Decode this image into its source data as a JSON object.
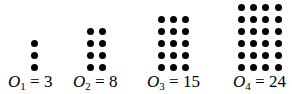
{
  "figures": [
    {
      "name": "O",
      "subscript": "1",
      "value": "3",
      "columns": 1,
      "rows": 3,
      "col_x": [
        34
      ],
      "label_x": 8
    },
    {
      "name": "O",
      "subscript": "2",
      "value": "8",
      "columns": 2,
      "rows": 4,
      "col_x": [
        90,
        102
      ],
      "label_x": 73
    },
    {
      "name": "O",
      "subscript": "3",
      "value": "15",
      "columns": 3,
      "rows": 5,
      "col_x": [
        161,
        173,
        185
      ],
      "label_x": 147
    },
    {
      "name": "O",
      "subscript": "4",
      "value": "24",
      "columns": 4,
      "rows": 6,
      "col_x": [
        241,
        253,
        265,
        278
      ],
      "label_x": 233
    }
  ],
  "layout": {
    "bottom_row_y": 67,
    "row_spacing": 12
  },
  "equals": "=",
  "colors": {
    "dot": "#000000",
    "background": "#ffffff"
  }
}
